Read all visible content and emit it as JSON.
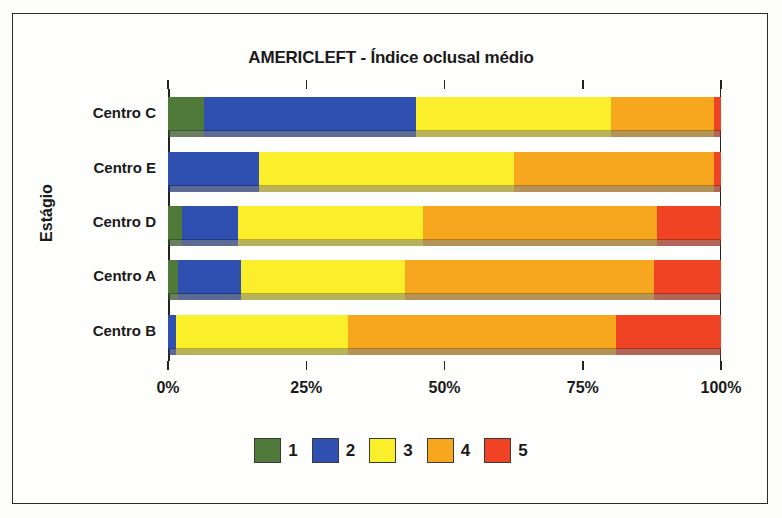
{
  "chart_data": {
    "type": "bar",
    "orientation": "horizontal",
    "stacked": true,
    "normalized": true,
    "title": "AMERICLEFT - Índice oclusal médio",
    "xlabel": "",
    "ylabel": "Estágio",
    "categories": [
      "Centro C",
      "Centro E",
      "Centro  D",
      "Centro A",
      "Centro B"
    ],
    "xlim": [
      0,
      100
    ],
    "xticks": [
      0,
      25,
      50,
      75,
      100
    ],
    "xtick_labels": [
      "0%",
      "25%",
      "50%",
      "75%",
      "100%"
    ],
    "grid": false,
    "legend_position": "bottom",
    "series": [
      {
        "name": "1",
        "color": "#4f7a3a",
        "values": [
          6.5,
          0.0,
          2.5,
          1.8,
          0.0
        ]
      },
      {
        "name": "2",
        "color": "#2f50b0",
        "values": [
          38.3,
          16.5,
          10.1,
          11.4,
          1.4
        ]
      },
      {
        "name": "3",
        "color": "#fbee2a",
        "values": [
          35.3,
          46.1,
          33.6,
          29.7,
          31.1
        ]
      },
      {
        "name": "4",
        "color": "#f6a71e",
        "values": [
          18.6,
          36.2,
          42.3,
          45.0,
          48.5
        ]
      },
      {
        "name": "5",
        "color": "#f04323",
        "values": [
          1.3,
          1.2,
          11.5,
          12.1,
          19.0
        ]
      }
    ],
    "legend": [
      {
        "label": "1",
        "color": "#4f7a3a"
      },
      {
        "label": "2",
        "color": "#2f50b0"
      },
      {
        "label": "3",
        "color": "#fbee2a"
      },
      {
        "label": "4",
        "color": "#f6a71e"
      },
      {
        "label": "5",
        "color": "#f04323"
      }
    ]
  }
}
